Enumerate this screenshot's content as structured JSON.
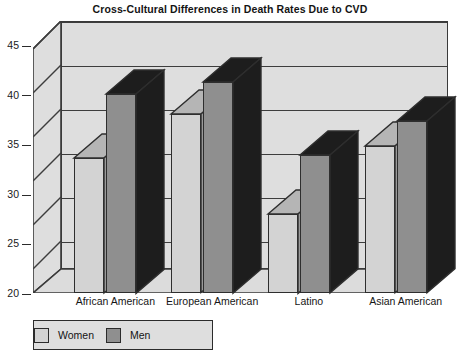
{
  "chart_data": {
    "type": "bar",
    "title": "Cross-Cultural Differences in Death Rates Due to CVD",
    "xlabel": "",
    "ylabel": "",
    "categories": [
      "African American",
      "European American",
      "Latino",
      "Asian American"
    ],
    "series": [
      {
        "name": "Women",
        "values": [
          33.6,
          38.0,
          28.0,
          34.8
        ],
        "color": "#d3d3d3"
      },
      {
        "name": "Men",
        "values": [
          40.1,
          41.3,
          33.9,
          37.3
        ],
        "color": "#8f8f8f"
      }
    ],
    "yticks": [
      20,
      25,
      30,
      35,
      40,
      45
    ],
    "ylim": [
      20,
      45
    ],
    "grid": true,
    "legend_position": "bottom-left",
    "style": "3d-column"
  },
  "legend": {
    "items": [
      {
        "label": "Women"
      },
      {
        "label": "Men"
      }
    ]
  },
  "colors": {
    "plot_background": "#dedede",
    "women_bar": "#d3d3d3",
    "men_bar": "#8f8f8f",
    "bar_top_dark": "#1d1d1d",
    "outline": "#2e2e2e",
    "page_background": "#ffffff"
  }
}
